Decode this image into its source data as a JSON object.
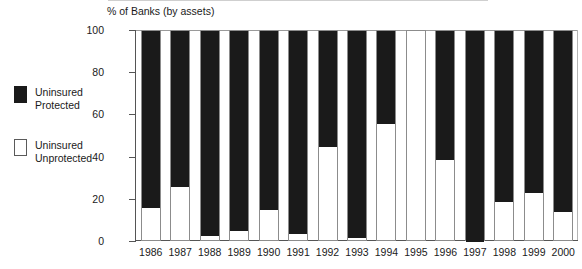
{
  "legend": {
    "items": [
      {
        "label": "Uninsured\nProtected",
        "style": "filled",
        "color": "#1a1a1a",
        "name": "uninsured-protected"
      },
      {
        "label": "Uninsured\nUnprotected",
        "style": "hollow",
        "color": "#ffffff",
        "name": "uninsured-unprotected"
      }
    ]
  },
  "chart_data": {
    "type": "bar",
    "subtype": "stacked-100-percent",
    "title": "",
    "axis_title": "% of Banks (by assets)",
    "xlabel": "",
    "ylabel": "% of Banks (by assets)",
    "ylim": [
      0,
      100
    ],
    "yticks": [
      0,
      20,
      40,
      60,
      80,
      100
    ],
    "ytick_labels": [
      "0",
      "20",
      "40",
      "60",
      "80",
      "100"
    ],
    "grid": false,
    "legend_position": "left",
    "categories": [
      "1986",
      "1987",
      "1988",
      "1989",
      "1990",
      "1991",
      "1992",
      "1993",
      "1994",
      "1995",
      "1996",
      "1997",
      "1998",
      "1999",
      "2000"
    ],
    "series": [
      {
        "name": "Uninsured Protected",
        "color": "#1a1a1a",
        "values": [
          84,
          74,
          97,
          95,
          85,
          96,
          55,
          98,
          44,
          0,
          61,
          100,
          81,
          77,
          86
        ]
      },
      {
        "name": "Uninsured Unprotected",
        "color": "#ffffff",
        "values": [
          16,
          26,
          3,
          5,
          15,
          4,
          45,
          2,
          56,
          100,
          39,
          0,
          19,
          23,
          14
        ]
      }
    ]
  }
}
